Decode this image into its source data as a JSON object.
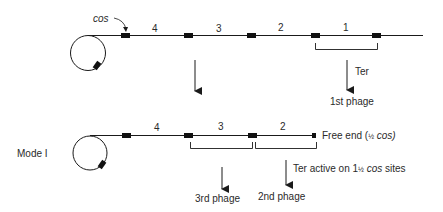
{
  "diagram": {
    "top": {
      "cos_label": "cos",
      "segment_labels": [
        "4",
        "3",
        "2",
        "1"
      ],
      "arrow_label": "Ter",
      "product_label": "1st phage"
    },
    "bottom": {
      "mode_label": "Mode I",
      "segment_labels": [
        "4",
        "3",
        "2"
      ],
      "free_end_prefix": "Free end (",
      "free_end_fraction": "½",
      "free_end_suffix": " cos)",
      "ter_prefix": "Ter active on 1",
      "ter_fraction": "½",
      "ter_cos": " cos",
      "ter_suffix": " sites",
      "product_labels": [
        "3rd phage",
        "2nd phage"
      ]
    },
    "colors": {
      "line": "#1a1a1a",
      "site": "#111111",
      "text": "#2a2a2a"
    }
  }
}
